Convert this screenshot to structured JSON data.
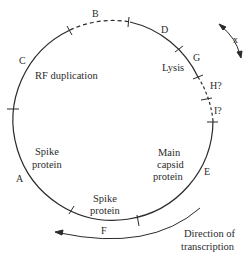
{
  "diagram": {
    "type": "circular-genome-map",
    "colors": {
      "line": "#2b2b2b",
      "text": "#2b2b2b",
      "background": "#ffffff"
    },
    "genes": [
      {
        "id": "A",
        "label": "A",
        "x": 16,
        "y": 182
      },
      {
        "id": "B",
        "label": "B",
        "x": 92,
        "y": 17
      },
      {
        "id": "C",
        "label": "C",
        "x": 19,
        "y": 64
      },
      {
        "id": "D",
        "label": "D",
        "x": 161,
        "y": 33
      },
      {
        "id": "E",
        "label": "E",
        "x": 204,
        "y": 175
      },
      {
        "id": "F",
        "label": "F",
        "x": 101,
        "y": 234
      },
      {
        "id": "G",
        "label": "G",
        "x": 194,
        "y": 61
      },
      {
        "id": "H",
        "label": "H?",
        "x": 209,
        "y": 89
      },
      {
        "id": "I",
        "label": "I?",
        "x": 214,
        "y": 114
      }
    ],
    "functions": [
      {
        "id": "rf-duplication",
        "lines": [
          "RF duplication"
        ],
        "x": 35,
        "y": 79
      },
      {
        "id": "lysis",
        "lines": [
          "Lysis"
        ],
        "x": 162,
        "y": 70
      },
      {
        "id": "spike-protein-left",
        "lines": [
          "Spike",
          "protein"
        ],
        "x": 48,
        "y": 154
      },
      {
        "id": "main-capsid-protein",
        "lines": [
          "Main",
          "capsid",
          "protein"
        ],
        "x": 170,
        "y": 157
      },
      {
        "id": "spike-protein-bottom",
        "lines": [
          "Spike",
          "protein"
        ],
        "x": 110,
        "y": 204
      }
    ],
    "annotations": {
      "x_arrow_label": "x",
      "direction_label_line1": "Direction of",
      "direction_label_line2": "transcription"
    }
  }
}
